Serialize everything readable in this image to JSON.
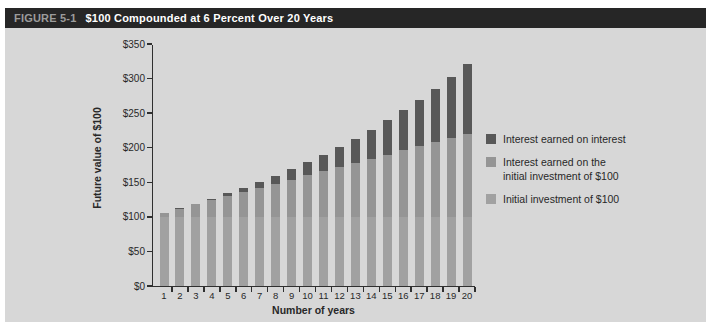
{
  "figure": {
    "label": "FIGURE 5-1",
    "title": "$100 Compounded at 6 Percent Over 20 Years"
  },
  "chart_data": {
    "type": "bar",
    "stacked": true,
    "xlabel": "Number of years",
    "ylabel": "Future value of $100",
    "ylim": [
      0,
      350
    ],
    "ytick_step": 50,
    "ytick_labels": [
      "$0",
      "$50",
      "$100",
      "$150",
      "$200",
      "$250",
      "$300",
      "$350"
    ],
    "categories": [
      "1",
      "2",
      "3",
      "4",
      "5",
      "6",
      "7",
      "8",
      "9",
      "10",
      "11",
      "12",
      "13",
      "14",
      "15",
      "16",
      "17",
      "18",
      "19",
      "20"
    ],
    "series": [
      {
        "name": "Initial investment of $100",
        "color": "#a1a1a1",
        "values": [
          100,
          100,
          100,
          100,
          100,
          100,
          100,
          100,
          100,
          100,
          100,
          100,
          100,
          100,
          100,
          100,
          100,
          100,
          100,
          100
        ]
      },
      {
        "name": "Interest earned on the initial investment of $100",
        "color": "#959595",
        "values": [
          6,
          12,
          18,
          24,
          30,
          36,
          42,
          48,
          54,
          60,
          66,
          72,
          78,
          84,
          90,
          96,
          102,
          108,
          114,
          120
        ]
      },
      {
        "name": "Interest earned on interest",
        "color": "#585858",
        "values": [
          0,
          0.36,
          1.1,
          2.25,
          3.82,
          5.85,
          8.36,
          11.38,
          14.95,
          19.08,
          23.83,
          29.22,
          35.29,
          42.09,
          49.66,
          58.04,
          67.28,
          77.43,
          88.56,
          100.71
        ]
      }
    ],
    "totals": [
      106.0,
      112.36,
      119.1,
      126.25,
      133.82,
      141.85,
      150.36,
      159.38,
      168.95,
      179.08,
      189.83,
      201.22,
      213.29,
      226.09,
      239.66,
      254.04,
      269.28,
      285.43,
      302.56,
      320.71
    ],
    "grid": false,
    "legend_position": "right"
  },
  "legend": {
    "items": [
      {
        "lines": [
          "Interest earned on interest"
        ],
        "color": "#585858"
      },
      {
        "lines": [
          "Interest earned on the",
          "initial investment of $100"
        ],
        "color": "#959595"
      },
      {
        "lines": [
          "Initial investment of $100"
        ],
        "color": "#a1a1a1"
      }
    ]
  }
}
